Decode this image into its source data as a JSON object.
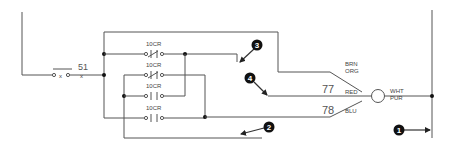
{
  "diagram": {
    "switch": {
      "label": "51"
    },
    "contacts": [
      {
        "label": "10CR",
        "type": "normally-closed"
      },
      {
        "label": "10CR",
        "type": "normally-closed"
      },
      {
        "label": "10CR",
        "type": "normally-open"
      },
      {
        "label": "10CR",
        "type": "normally-open"
      }
    ],
    "wires": [
      {
        "number": "77",
        "color_label": "RED"
      },
      {
        "number": "78",
        "color_label": "BLU"
      }
    ],
    "connector_labels": {
      "top_line1": "BRN",
      "top_line2": "ORG",
      "output_line1": "WHT",
      "output_line2": "PUR"
    },
    "markers": [
      {
        "number": "1"
      },
      {
        "number": "2"
      },
      {
        "number": "3"
      },
      {
        "number": "4"
      }
    ],
    "colors": {
      "wire": "#555555",
      "marker": "#111111",
      "background": "#ffffff"
    }
  }
}
